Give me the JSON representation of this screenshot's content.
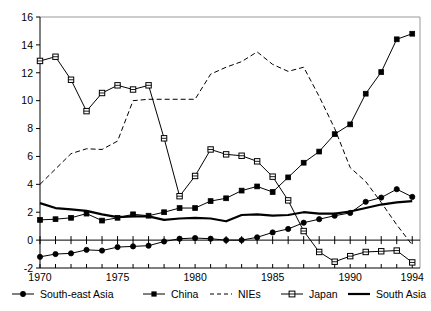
{
  "chart_data": {
    "type": "line",
    "title": "",
    "subtitle": "",
    "xlabel": "",
    "ylabel": "",
    "xlim": [
      1970,
      1994.5
    ],
    "ylim": [
      -2,
      16
    ],
    "yticks": [
      -2,
      0,
      2,
      4,
      6,
      8,
      10,
      12,
      14,
      16
    ],
    "xticks": [
      1970,
      1975,
      1980,
      1985,
      1990,
      1994
    ],
    "xtick_labels": [
      "1970",
      "1975",
      "1980",
      "1985",
      "1990",
      "1994"
    ],
    "ytick_labels": [
      "-2",
      "0",
      "2",
      "4",
      "6",
      "8",
      "10",
      "12",
      "14",
      "16"
    ],
    "x": [
      1970,
      1971,
      1972,
      1973,
      1974,
      1975,
      1976,
      1977,
      1978,
      1979,
      1980,
      1981,
      1982,
      1983,
      1984,
      1985,
      1986,
      1987,
      1988,
      1989,
      1990,
      1991,
      1992,
      1993,
      1994
    ],
    "grid": false,
    "legend_position": "bottom",
    "series": [
      {
        "name": "South-east Asia",
        "marker": "filled-circle",
        "line_style": "solid",
        "color": "#000000",
        "values": [
          -1.2,
          -1.0,
          -0.95,
          -0.7,
          -0.75,
          -0.5,
          -0.45,
          -0.4,
          -0.1,
          0.1,
          0.15,
          0.1,
          0.0,
          0.0,
          0.2,
          0.55,
          0.8,
          1.25,
          1.5,
          1.75,
          1.95,
          2.75,
          3.05,
          3.65,
          3.1
        ]
      },
      {
        "name": "China",
        "marker": "filled-square",
        "line_style": "solid",
        "color": "#000000",
        "values": [
          1.45,
          1.5,
          1.6,
          1.9,
          1.4,
          1.6,
          1.85,
          1.75,
          2.0,
          2.3,
          2.3,
          2.8,
          3.0,
          3.55,
          3.85,
          3.45,
          4.5,
          5.55,
          6.35,
          7.6,
          8.3,
          10.5,
          12.05,
          14.4,
          14.8
        ]
      },
      {
        "name": "NIEs",
        "marker": "none",
        "line_style": "dashed",
        "color": "#000000",
        "values": [
          4.0,
          5.1,
          6.2,
          6.55,
          6.5,
          7.1,
          10.0,
          10.1,
          10.1,
          10.1,
          10.1,
          11.9,
          12.4,
          12.8,
          13.5,
          12.6,
          12.1,
          12.4,
          10.3,
          8.0,
          5.2,
          4.2,
          2.7,
          1.1,
          -0.35
        ]
      },
      {
        "name": "Japan",
        "marker": "open-square",
        "line_style": "solid",
        "color": "#000000",
        "values": [
          12.85,
          13.15,
          11.5,
          9.25,
          10.55,
          11.1,
          10.8,
          11.1,
          7.3,
          3.15,
          4.6,
          6.5,
          6.15,
          6.05,
          5.65,
          4.55,
          2.85,
          0.65,
          -0.85,
          -1.55,
          -1.15,
          -0.85,
          -0.8,
          -0.75,
          -1.6
        ]
      },
      {
        "name": "South Asia",
        "marker": "none",
        "line_style": "solid-thick",
        "color": "#000000",
        "values": [
          2.65,
          2.3,
          2.2,
          2.1,
          1.85,
          1.65,
          1.7,
          1.7,
          1.45,
          1.55,
          1.6,
          1.55,
          1.35,
          1.8,
          1.85,
          1.75,
          1.8,
          2.0,
          1.9,
          1.9,
          2.05,
          2.3,
          2.55,
          2.7,
          2.8
        ]
      }
    ],
    "legend": [
      {
        "label": "South-east Asia",
        "marker": "filled-circle",
        "line_style": "solid"
      },
      {
        "label": "China",
        "marker": "filled-square",
        "line_style": "solid"
      },
      {
        "label": "NIEs",
        "marker": "none",
        "line_style": "dashed"
      },
      {
        "label": "Japan",
        "marker": "open-square",
        "line_style": "solid"
      },
      {
        "label": "South Asia",
        "marker": "none",
        "line_style": "solid-thick"
      }
    ]
  }
}
